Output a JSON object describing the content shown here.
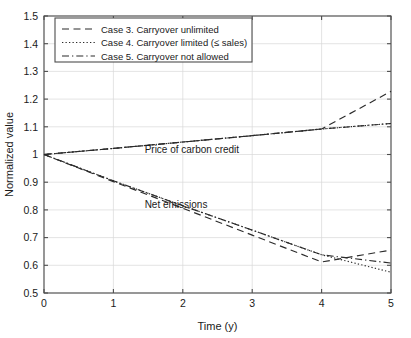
{
  "chart_data": {
    "type": "line",
    "title": "",
    "xlabel": "Time (y)",
    "ylabel": "Normalized value",
    "xlim": [
      0,
      5
    ],
    "ylim": [
      0.5,
      1.5
    ],
    "xticks": [
      "0",
      "1",
      "2",
      "3",
      "4",
      "5"
    ],
    "yticks": [
      "0.5",
      "0.6",
      "0.7",
      "0.8",
      "0.9",
      "1",
      "1.1",
      "1.2",
      "1.3",
      "1.4",
      "1.5"
    ],
    "grid": true,
    "legend_position": "upper-left",
    "x": [
      0,
      1,
      2,
      3,
      4,
      5
    ],
    "series": [
      {
        "name": "Case 3. Carryover unlimited",
        "group": "Price of carbon credit",
        "style": "dashed",
        "values": [
          1.0,
          1.022,
          1.045,
          1.068,
          1.092,
          1.228
        ]
      },
      {
        "name": "Case 4. Carryover limited (≤ sales)",
        "group": "Price of carbon credit",
        "style": "dotted",
        "values": [
          1.0,
          1.022,
          1.045,
          1.068,
          1.092,
          1.112
        ]
      },
      {
        "name": "Case 5. Carryover not allowed",
        "group": "Price of carbon credit",
        "style": "dashdot",
        "values": [
          1.0,
          1.022,
          1.045,
          1.068,
          1.092,
          1.112
        ]
      },
      {
        "name": "Case 3. Carryover unlimited",
        "group": "Net emissions",
        "style": "dashed",
        "values": [
          1.0,
          0.902,
          0.806,
          0.709,
          0.612,
          0.655
        ]
      },
      {
        "name": "Case 4. Carryover limited (≤ sales)",
        "group": "Net emissions",
        "style": "dotted",
        "values": [
          1.0,
          0.905,
          0.815,
          0.727,
          0.638,
          0.575
        ]
      },
      {
        "name": "Case 5. Carryover not allowed",
        "group": "Net emissions",
        "style": "dashdot",
        "values": [
          1.0,
          0.905,
          0.815,
          0.727,
          0.638,
          0.608
        ]
      }
    ],
    "annotations": [
      {
        "text": "Price of carbon credit",
        "x": 1.45,
        "y": 1.005
      },
      {
        "text": "Net emissions",
        "x": 1.45,
        "y": 0.808
      }
    ],
    "legend": [
      {
        "label": "Case 3. Carryover unlimited",
        "style": "dashed"
      },
      {
        "label": "Case 4. Carryover limited (≤ sales)",
        "style": "dotted"
      },
      {
        "label": "Case 5. Carryover not allowed",
        "style": "dashdot"
      }
    ],
    "colors": {
      "line": "#2b2b2b",
      "axis": "#4d4d4d",
      "grid": "#d8d8d8",
      "background": "#ffffff"
    }
  }
}
